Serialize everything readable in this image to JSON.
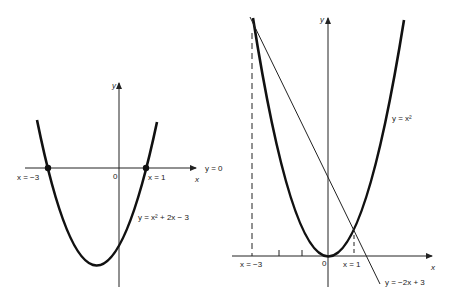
{
  "left_graph": {
    "curve_label": "y = x² + 2x − 3",
    "line_label": "y = 0",
    "root_left_label": "x = −3",
    "root_right_label": "x = 1",
    "origin_label": "0",
    "x_axis_label": "x",
    "y_axis_label": "y"
  },
  "right_graph": {
    "curve_label": "y = x²",
    "line_label": "y = −2x + 3",
    "intersect_left_label": "x = −3",
    "intersect_right_label": "x = 1",
    "origin_label": "0",
    "x_axis_label": "x",
    "y_axis_label": "y"
  }
}
